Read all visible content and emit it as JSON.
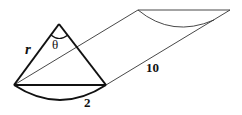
{
  "diagram": {
    "type": "cone-sector-prism",
    "labels": {
      "radius": "r",
      "angle": "θ",
      "arc_length": "2",
      "length": "10"
    },
    "colors": {
      "stroke": "#111111",
      "thin_stroke": "#333333",
      "background": "#ffffff"
    }
  }
}
